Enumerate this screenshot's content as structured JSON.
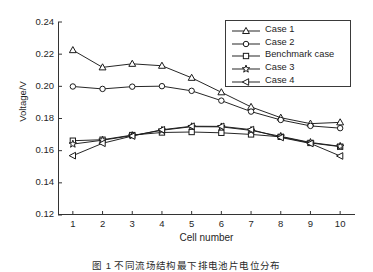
{
  "chart_data": {
    "type": "line",
    "title": "",
    "xlabel": "Cell number",
    "ylabel": "Voltage/V",
    "x": [
      1,
      2,
      3,
      4,
      5,
      6,
      7,
      8,
      9,
      10
    ],
    "xlim": [
      0.5,
      10.5
    ],
    "ylim": [
      0.12,
      0.24
    ],
    "yticks": [
      "0.24",
      "0.22",
      "0.20",
      "0.18",
      "0.16",
      "0.14",
      "0.12"
    ],
    "ytick_values": [
      0.24,
      0.22,
      0.2,
      0.18,
      0.16,
      0.14,
      0.12
    ],
    "xticks": [
      "1",
      "2",
      "3",
      "4",
      "5",
      "6",
      "7",
      "8",
      "9",
      "10"
    ],
    "grid": false,
    "legend_position": "top-right",
    "series": [
      {
        "name": "Case 1",
        "marker": "triangle-up",
        "values": [
          0.2225,
          0.2118,
          0.214,
          0.2128,
          0.2053,
          0.1963,
          0.1872,
          0.1805,
          0.1768,
          0.1776
        ]
      },
      {
        "name": "Case 2",
        "marker": "circle",
        "values": [
          0.1999,
          0.1984,
          0.1998,
          0.2001,
          0.1972,
          0.1911,
          0.1843,
          0.1791,
          0.1754,
          0.174
        ]
      },
      {
        "name": "Benchmark case",
        "marker": "square",
        "values": [
          0.1662,
          0.1668,
          0.1697,
          0.1713,
          0.1716,
          0.1711,
          0.1701,
          0.1686,
          0.1648,
          0.1625
        ]
      },
      {
        "name": "Case 3",
        "marker": "star",
        "values": [
          0.1641,
          0.1665,
          0.1694,
          0.1727,
          0.1749,
          0.1748,
          0.1726,
          0.1689,
          0.1651,
          0.1627
        ]
      },
      {
        "name": "Case 4",
        "marker": "triangle-left",
        "values": [
          0.1569,
          0.1646,
          0.1691,
          0.173,
          0.1752,
          0.1751,
          0.1731,
          0.1682,
          0.1645,
          0.1567
        ]
      }
    ]
  },
  "legend": {
    "items": [
      {
        "label": "Case 1"
      },
      {
        "label": "Case 2"
      },
      {
        "label": "Benchmark case"
      },
      {
        "label": "Case 3"
      },
      {
        "label": "Case 4"
      }
    ]
  },
  "caption": {
    "text": "图 1  不同流场结构最下排电池片电位分布"
  },
  "colors": {
    "line": "#1a1a1a",
    "axis": "#333333",
    "background": "#ffffff"
  }
}
